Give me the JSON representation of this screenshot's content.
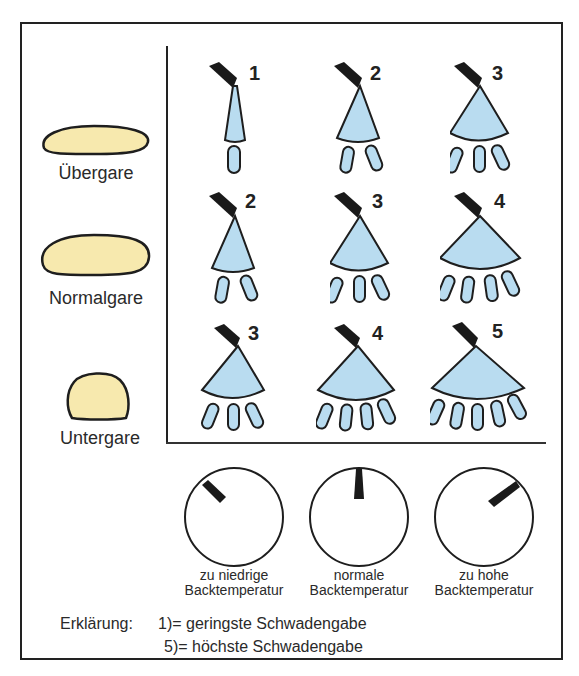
{
  "colors": {
    "dough_fill": "#f7e9ae",
    "spray_fill": "#b9dcf0",
    "outline": "#1e1e1e",
    "nozzle": "#1a1a1a"
  },
  "proof_states": [
    {
      "label": "Übergare"
    },
    {
      "label": "Normalgare"
    },
    {
      "label": "Untergare"
    }
  ],
  "steam_grid": {
    "rows": [
      {
        "state": "Übergare",
        "levels": [
          "1",
          "2",
          "3"
        ]
      },
      {
        "state": "Normalgare",
        "levels": [
          "2",
          "3",
          "4"
        ]
      },
      {
        "state": "Untergare",
        "levels": [
          "3",
          "4",
          "5"
        ]
      }
    ]
  },
  "dials": [
    {
      "line1": "zu niedrige",
      "line2": "Backtemperatur",
      "angle_deg": -40
    },
    {
      "line1": "normale",
      "line2": "Backtemperatur",
      "angle_deg": 0
    },
    {
      "line1": "zu hohe",
      "line2": "Backtemperatur",
      "angle_deg": 50
    }
  ],
  "legend": {
    "title": "Erklärung:",
    "line1": "1)= geringste Schwadengabe",
    "line2": "5)= höchste Schwadengabe"
  }
}
